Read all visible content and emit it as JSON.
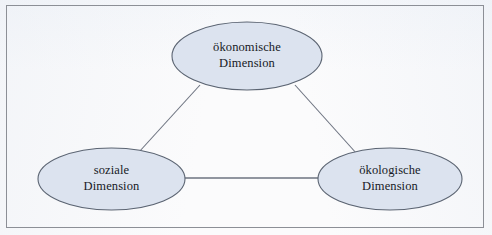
{
  "figure": {
    "type": "concept-diagram",
    "border_color": "#8c8f96",
    "background_color": "#fbfbfc"
  },
  "style": {
    "node_fill": "#dce3ef",
    "node_stroke": "#5b6472",
    "connector_color": "#6d7380",
    "text_color": "#171a1f"
  },
  "nodes": [
    {
      "id": "oekonomische",
      "line1": "ökonomische",
      "line2": "Dimension",
      "cx": 247,
      "cy": 56,
      "rx": 75,
      "ry": 34
    },
    {
      "id": "soziale",
      "line1": "soziale",
      "line2": "Dimension",
      "cx": 111.5,
      "cy": 179,
      "rx": 73.5,
      "ry": 31
    },
    {
      "id": "oekologische",
      "line1": "ökologische",
      "line2": "Dimension",
      "cx": 390,
      "cy": 179,
      "rx": 72,
      "ry": 31
    }
  ],
  "connectors": [
    {
      "id": "oekonomische-soziale",
      "from": "oekonomische",
      "to": "soziale",
      "x1": 200,
      "y1": 85,
      "x2": 139,
      "y2": 152
    },
    {
      "id": "oekonomische-oekologische",
      "from": "oekonomische",
      "to": "oekologische",
      "x1": 295,
      "y1": 85,
      "x2": 357,
      "y2": 154
    },
    {
      "id": "soziale-oekologische",
      "from": "soziale",
      "to": "oekologische",
      "x1": 185,
      "y1": 178,
      "x2": 318,
      "y2": 178
    }
  ]
}
